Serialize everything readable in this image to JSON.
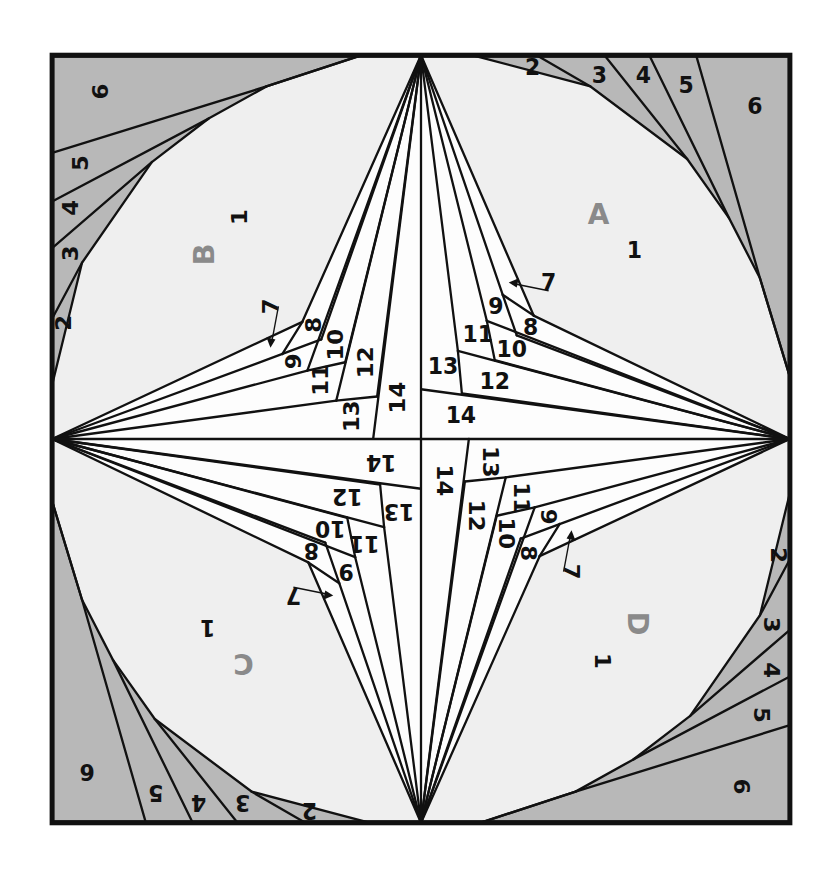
{
  "diagram": {
    "colors": {
      "gray": "#b8b8b8",
      "light": "#efefef",
      "spike": "#fdfdfd",
      "line": "#111111",
      "section_label": "#8a8a8a"
    },
    "sections": [
      {
        "id": "A",
        "label": "A",
        "rotation": 0
      },
      {
        "id": "B",
        "label": "B",
        "rotation": -90
      },
      {
        "id": "C",
        "label": "C",
        "rotation": 180
      },
      {
        "id": "D",
        "label": "D",
        "rotation": 90
      }
    ],
    "piece_numbers": {
      "p1": "1",
      "p2": "2",
      "p3": "3",
      "p4": "4",
      "p5": "5",
      "p6": "6",
      "p7": "7",
      "p8": "8",
      "p9": "9",
      "p10": "10",
      "p11": "11",
      "p12": "12",
      "p13": "13",
      "p14": "14"
    }
  }
}
